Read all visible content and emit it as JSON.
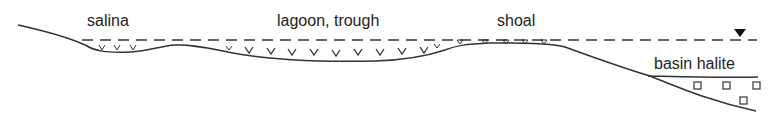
{
  "diagram": {
    "type": "cross-section",
    "labels": {
      "salina": "salina",
      "lagoon": "lagoon, trough",
      "shoal": "shoal",
      "basin": "basin halite"
    },
    "legend_symbols": {
      "sea_level": "water-level-triangle",
      "gypsum": "v-shaped crystal marks (gypsum)",
      "halite": "square crystal marks (halite)"
    },
    "colors": {
      "line": "#333333",
      "text": "#222222",
      "background": "#ffffff"
    }
  }
}
